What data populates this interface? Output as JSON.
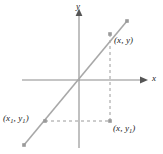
{
  "figure": {
    "type": "coordinate-geometry-diagram",
    "width": 163,
    "height": 154,
    "background_color": "#ffffff"
  },
  "axes": {
    "x_axis": {
      "label": "x",
      "arrowhead": "right",
      "color": "#8c8c8c",
      "y_position": 80,
      "x_start": 22,
      "x_end": 143
    },
    "y_axis": {
      "label": "y",
      "arrowhead": "up",
      "color": "#8c8c8c",
      "x_position": 79,
      "y_start": 12,
      "y_end": 148
    },
    "origin": {
      "x": 79,
      "y": 80
    }
  },
  "line": {
    "name": "secant-line",
    "color": "#a8a8a8",
    "from": {
      "x": 24,
      "y": 145
    },
    "to": {
      "x": 127,
      "y": 21
    },
    "endpoint_markers": true
  },
  "points": [
    {
      "id": "point-xy",
      "label": "(x, y)",
      "label_main": "(x, y)",
      "x": 110,
      "y": 41
    },
    {
      "id": "point-x1y1",
      "label": "(x1, y1)",
      "label_main": "(x",
      "label_sub1": "1",
      "label_mid": ", y",
      "label_sub2": "1",
      "label_end": ")",
      "x": 45,
      "y": 121
    },
    {
      "id": "point-xy1",
      "label": "(x, y1)",
      "label_main": "(x, y",
      "label_sub": "1",
      "label_end": ")",
      "x": 110,
      "y": 121
    }
  ],
  "dashed_lines": {
    "color": "#9a9a9a",
    "dash_pattern": "3 3",
    "vertical": {
      "x": 110,
      "y_top": 34,
      "y_bottom": 121
    },
    "horizontal": {
      "y": 121,
      "x_left": 45,
      "x_right": 110
    }
  },
  "labels": {
    "point_xy": "(x, y)",
    "point_x1y1_open": "(x",
    "point_x1y1_sub1": "1",
    "point_x1y1_mid": ", y",
    "point_x1y1_sub2": "1",
    "point_x1y1_close": ")",
    "point_xy1_open": "(x, y",
    "point_xy1_sub": "1",
    "point_xy1_close": ")",
    "axis_x": "x",
    "axis_y": "y"
  },
  "colors": {
    "axis": "#8c8c8c",
    "line": "#a8a8a8",
    "dashed": "#9a9a9a",
    "text": "#1a1a1a",
    "marker": "#9a9a9a",
    "background": "#ffffff"
  }
}
